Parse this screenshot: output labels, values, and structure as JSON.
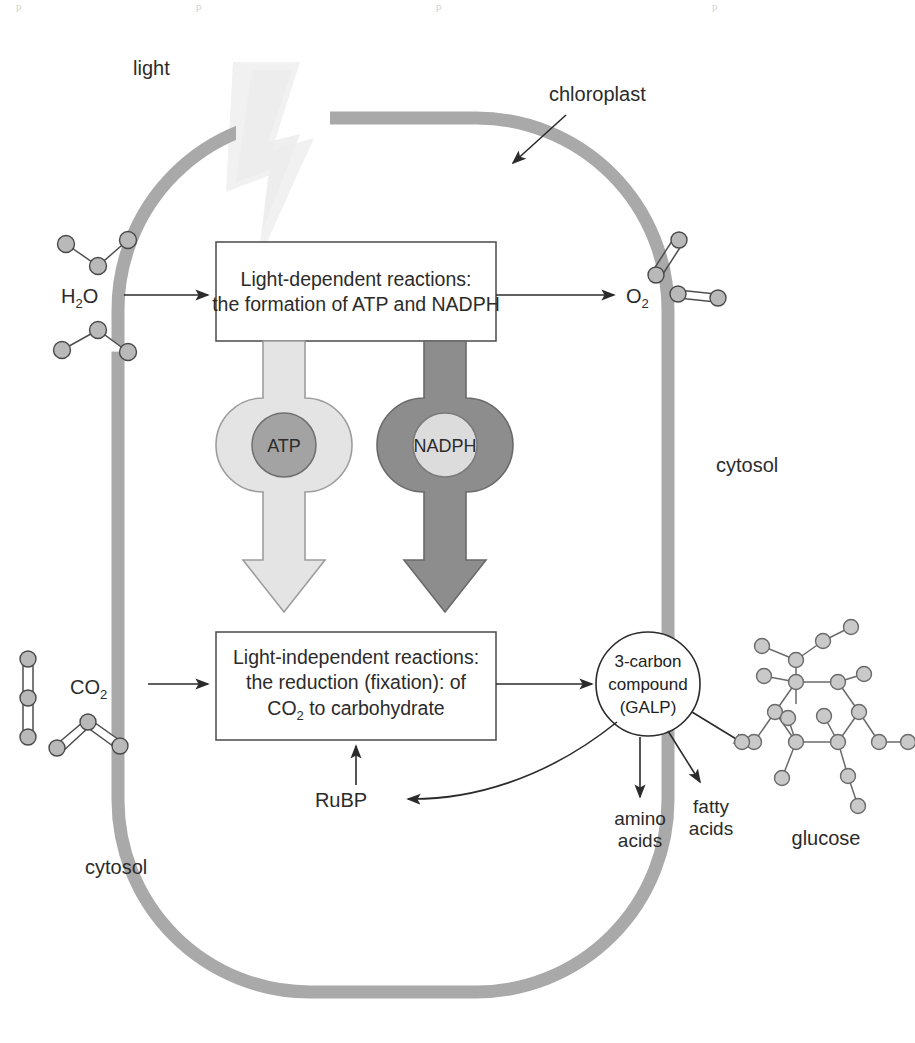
{
  "figure": {
    "background_color": "#ffffff"
  },
  "colors": {
    "membrane": "#a9a9a9",
    "membrane_edge": "#9a9a9a",
    "atp_ring": "#e0e0e0",
    "atp_ring_stroke": "#9d9d9d",
    "atp_core": "#a3a3a3",
    "atp_core_stroke": "#6f6f6f",
    "nadph_ring": "#8b8b8b",
    "nadph_ring_stroke": "#6a6a6a",
    "nadph_core": "#dcdcdc",
    "nadph_core_stroke": "#7a7a7a",
    "light_beam": "#f2f2f2",
    "molecule_atom": "#b9b9b9",
    "glucose_atom": "#c9c9c9",
    "line": "#2b2b2b",
    "text": "#2b2b2b"
  },
  "labels": {
    "light": "light",
    "chloroplast": "chloroplast",
    "cytosol_right": "cytosol",
    "cytosol_left": "cytosol",
    "water": "H",
    "water_sub": "2",
    "water_tail": "O",
    "oxygen": "O",
    "oxygen_sub": "2",
    "carbon_dioxide": "CO",
    "carbon_dioxide_sub": "2",
    "rubp": "RuBP",
    "amino_acids_line1": "amino",
    "amino_acids_line2": "acids",
    "fatty_acids_line1": "fatty",
    "fatty_acids_line2": "acids",
    "glucose": "glucose"
  },
  "light_dependent_box": {
    "line1": "Light-dependent reactions:",
    "line2": "the formation of ATP and NADPH"
  },
  "light_independent_box": {
    "line1": "Light-independent reactions:",
    "line2": "the reduction (fixation): of",
    "line3_pre": "CO",
    "line3_sub": "2",
    "line3_post": " to carbohydrate"
  },
  "carriers": [
    {
      "name": "ATP",
      "label": "ATP",
      "style": "light-ring-dark-core"
    },
    {
      "name": "NADPH",
      "label": "NADPH",
      "style": "dark-ring-light-core"
    }
  ],
  "three_carbon_node": {
    "line1": "3-carbon",
    "line2": "compound",
    "line3": "(GALP)"
  },
  "molecule_groups": [
    {
      "name": "water-molecules",
      "formula": "H2O",
      "count": 2,
      "shape": "bent-triatomic"
    },
    {
      "name": "oxygen-molecules",
      "formula": "O2",
      "count": 2,
      "shape": "linear-diatomic-double-bond"
    },
    {
      "name": "carbon-dioxide-molecules",
      "formula": "CO2",
      "count": 2,
      "shape": "triatomic"
    },
    {
      "name": "glucose-molecule",
      "formula": "C6H12O6",
      "count": 1,
      "shape": "pyranose-ring"
    }
  ],
  "flow": {
    "water_to_light_reactions": "H2O enters light-dependent reactions",
    "light_reactions_to_oxygen": "O2 released",
    "atp_transfer": "ATP to light-independent reactions",
    "nadph_transfer": "NADPH to light-independent reactions",
    "co2_to_dark_reactions": "CO2 enters light-independent reactions",
    "dark_reactions_to_galp": "3-carbon compound (GALP) produced",
    "galp_to_rubp": "GALP regenerates RuBP",
    "rubp_to_dark_reactions": "RuBP re-enters light-independent reactions",
    "galp_to_amino_acids": "amino acids",
    "galp_to_fatty_acids": "fatty acids",
    "galp_to_glucose": "glucose"
  },
  "scan_artifacts": {
    "top_fragments": [
      "p",
      "p",
      "p",
      "p"
    ]
  }
}
